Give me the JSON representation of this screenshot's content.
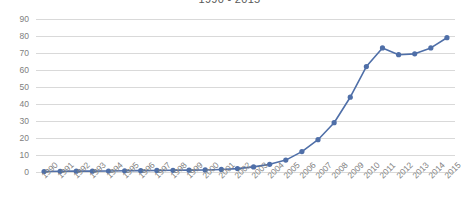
{
  "chart_data": {
    "type": "line",
    "title": "1990 - 2015",
    "xlabel": "",
    "ylabel": "",
    "categories": [
      "1990",
      "1991",
      "1992",
      "1993",
      "1994",
      "1995",
      "1996",
      "1997",
      "1998",
      "1999",
      "2000",
      "2001",
      "2002",
      "2003",
      "2004",
      "2005",
      "2006",
      "2007",
      "2008",
      "2009",
      "2010",
      "2011",
      "2012",
      "2013",
      "2014",
      "2015"
    ],
    "values": [
      0.3,
      0.4,
      0.5,
      0.5,
      0.6,
      0.7,
      0.8,
      0.9,
      1.0,
      1.1,
      1.2,
      1.5,
      2,
      3,
      4.5,
      7,
      12,
      19,
      29,
      44,
      62,
      73,
      69,
      69.5,
      73,
      79
    ],
    "series": [
      {
        "name": "Series 1",
        "values": [
          0.3,
          0.4,
          0.5,
          0.5,
          0.6,
          0.7,
          0.8,
          0.9,
          1.0,
          1.1,
          1.2,
          1.5,
          2,
          3,
          4.5,
          7,
          12,
          19,
          29,
          44,
          62,
          73,
          69,
          69.5,
          73,
          79
        ],
        "color": "#4f6fa8"
      }
    ],
    "ylim": [
      0,
      90
    ],
    "yticks": [
      0,
      10,
      20,
      30,
      40,
      50,
      60,
      70,
      80,
      90
    ],
    "grid": true,
    "legend": "none",
    "marker": "circle",
    "line_color": "#4f6fa8",
    "marker_color": "#4f6fa8",
    "gridline_color": "#d9d9d9",
    "tick_label_color": "#808080",
    "title_color": "#595959",
    "background_color": "#ffffff"
  }
}
